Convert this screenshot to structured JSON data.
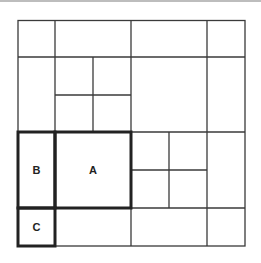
{
  "diagram": {
    "line_color": "#333333",
    "highlight_color": "#222222",
    "labels": {
      "a": "A",
      "b": "B",
      "c": "C"
    }
  }
}
